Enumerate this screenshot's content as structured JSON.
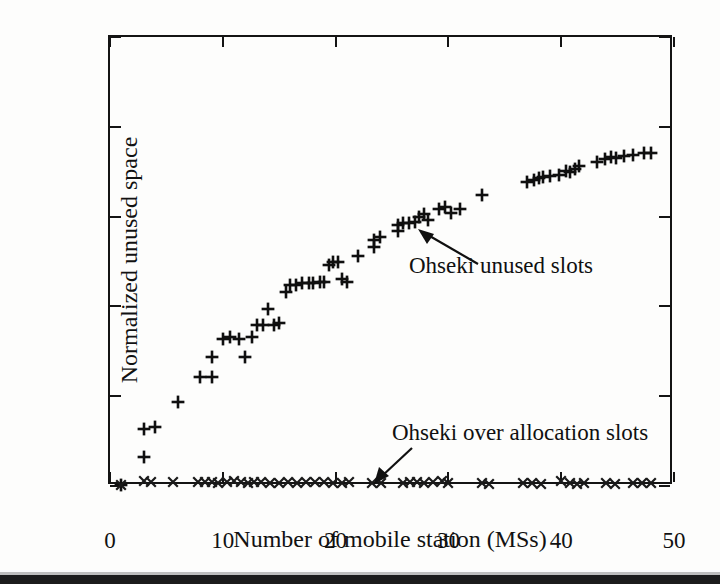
{
  "figure": {
    "background_color": "#fdfdfc",
    "ink_color": "#111111"
  },
  "chart_data": {
    "type": "scatter",
    "title": "",
    "xlabel": "Number of mobile station (MSs)",
    "ylabel": "Normalized unused space",
    "xlim": [
      0,
      50
    ],
    "ylim": [
      0,
      1
    ],
    "xticks": [
      0,
      10,
      20,
      30,
      40,
      50
    ],
    "xticklabels": [
      "0",
      "10",
      "20",
      "30",
      "40",
      "50"
    ],
    "yticks": [
      0,
      0.2,
      0.4,
      0.6,
      0.8,
      1
    ],
    "yticklabels": [
      "0",
      "0.2",
      "0.4",
      "0.6",
      "0.8",
      "1"
    ],
    "grid": false,
    "legend": "none (inline arrow annotations)",
    "annotations": [
      {
        "text": "Ohseki unused slots",
        "points_to_series": "Ohseki unused slots",
        "target_x": 24.5,
        "target_y": 0.565
      },
      {
        "text": "Ohseki over allocation slots",
        "points_to_series": "Ohseki over allocation slots",
        "target_x": 23.2,
        "target_y": 0.01
      }
    ],
    "series": [
      {
        "name": "Ohseki unused slots",
        "marker": "plus",
        "color": "#0f0f0f",
        "points": [
          [
            1,
            0.003
          ],
          [
            3,
            0.065
          ],
          [
            3,
            0.128
          ],
          [
            4,
            0.132
          ],
          [
            6,
            0.188
          ],
          [
            8,
            0.242
          ],
          [
            9,
            0.242
          ],
          [
            9,
            0.287
          ],
          [
            10,
            0.327
          ],
          [
            10.6,
            0.332
          ],
          [
            11.4,
            0.328
          ],
          [
            12,
            0.287
          ],
          [
            12.6,
            0.332
          ],
          [
            13,
            0.358
          ],
          [
            13.6,
            0.358
          ],
          [
            14,
            0.395
          ],
          [
            14.5,
            0.358
          ],
          [
            15,
            0.362
          ],
          [
            15.6,
            0.432
          ],
          [
            16,
            0.448
          ],
          [
            16.5,
            0.448
          ],
          [
            17,
            0.452
          ],
          [
            17.6,
            0.452
          ],
          [
            18,
            0.452
          ],
          [
            18.6,
            0.455
          ],
          [
            19,
            0.455
          ],
          [
            19.4,
            0.492
          ],
          [
            19.8,
            0.498
          ],
          [
            20.2,
            0.498
          ],
          [
            20.6,
            0.462
          ],
          [
            21,
            0.455
          ],
          [
            22,
            0.512
          ],
          [
            23.4,
            0.548
          ],
          [
            23.4,
            0.532
          ],
          [
            23.9,
            0.555
          ],
          [
            25.5,
            0.582
          ],
          [
            25.5,
            0.568
          ],
          [
            26,
            0.585
          ],
          [
            26.5,
            0.585
          ],
          [
            27,
            0.588
          ],
          [
            27.4,
            0.598
          ],
          [
            27.8,
            0.605
          ],
          [
            28.2,
            0.592
          ],
          [
            29.2,
            0.618
          ],
          [
            29.7,
            0.622
          ],
          [
            30.2,
            0.608
          ],
          [
            31,
            0.618
          ],
          [
            33,
            0.648
          ],
          [
            37,
            0.678
          ],
          [
            37.6,
            0.682
          ],
          [
            38,
            0.685
          ],
          [
            38.4,
            0.688
          ],
          [
            39,
            0.69
          ],
          [
            39.8,
            0.692
          ],
          [
            40.4,
            0.702
          ],
          [
            40.8,
            0.7
          ],
          [
            41.2,
            0.705
          ],
          [
            41.6,
            0.712
          ],
          [
            43.2,
            0.722
          ],
          [
            43.9,
            0.728
          ],
          [
            44.4,
            0.732
          ],
          [
            44.9,
            0.73
          ],
          [
            45.6,
            0.735
          ],
          [
            46.4,
            0.738
          ],
          [
            47.3,
            0.742
          ],
          [
            48,
            0.742
          ]
        ]
      },
      {
        "name": "Ohseki over allocation slots",
        "marker": "cross",
        "color": "#1a1a1a",
        "points": [
          [
            1,
            0.003
          ],
          [
            3,
            0.012
          ],
          [
            3.6,
            0.01
          ],
          [
            5.6,
            0.01
          ],
          [
            7.8,
            0.008
          ],
          [
            8.4,
            0.008
          ],
          [
            9,
            0.01
          ],
          [
            9.6,
            0.006
          ],
          [
            10.4,
            0.01
          ],
          [
            11,
            0.012
          ],
          [
            11.6,
            0.008
          ],
          [
            12.2,
            0.006
          ],
          [
            12.8,
            0.008
          ],
          [
            13.4,
            0.008
          ],
          [
            14.2,
            0.006
          ],
          [
            15,
            0.006
          ],
          [
            15.8,
            0.008
          ],
          [
            16.6,
            0.006
          ],
          [
            17.4,
            0.008
          ],
          [
            18.2,
            0.008
          ],
          [
            19,
            0.008
          ],
          [
            19.8,
            0.006
          ],
          [
            20.6,
            0.006
          ],
          [
            21.2,
            0.008
          ],
          [
            23.2,
            0.006
          ],
          [
            24,
            0.006
          ],
          [
            26,
            0.006
          ],
          [
            26.6,
            0.008
          ],
          [
            27.2,
            0.008
          ],
          [
            27.8,
            0.006
          ],
          [
            28.6,
            0.008
          ],
          [
            29.4,
            0.012
          ],
          [
            30,
            0.006
          ],
          [
            33,
            0.006
          ],
          [
            33.6,
            0.004
          ],
          [
            36.6,
            0.006
          ],
          [
            37.4,
            0.006
          ],
          [
            38.2,
            0.004
          ],
          [
            40,
            0.012
          ],
          [
            40.8,
            0.006
          ],
          [
            41.4,
            0.004
          ],
          [
            42,
            0.006
          ],
          [
            44,
            0.006
          ],
          [
            44.8,
            0.004
          ],
          [
            46.4,
            0.006
          ],
          [
            47.2,
            0.006
          ],
          [
            48,
            0.006
          ]
        ]
      }
    ]
  }
}
